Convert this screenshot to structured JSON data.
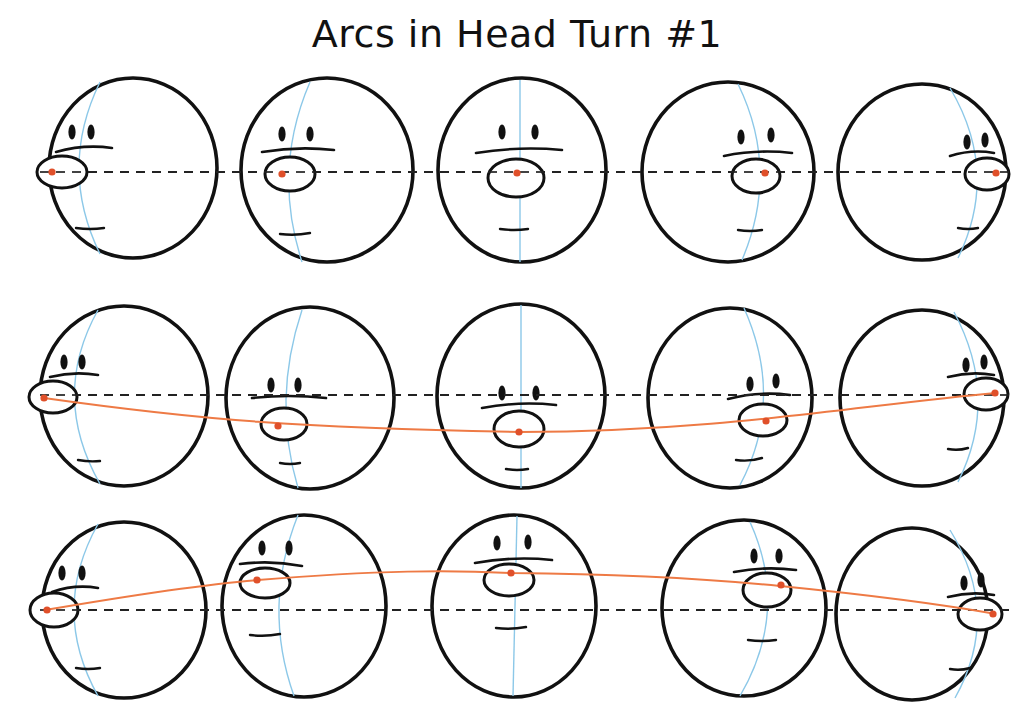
{
  "title": "Arcs in Head Turn #1",
  "colors": {
    "outline": "#111111",
    "center_line": "#8cc8e8",
    "nose_dot": "#e0502a",
    "arc": "#ee7a45",
    "guide": "#222222"
  },
  "rows": [
    {
      "name": "row-1-straight",
      "guide_y": 172,
      "arc": false,
      "heads": [
        {
          "cx": 133,
          "cy": 168,
          "rx": 84,
          "ry": 90,
          "view": "profile-left",
          "nose": {
            "x": 62,
            "y": 172,
            "rx": 25,
            "ry": 16
          },
          "dot": {
            "x": 52,
            "y": 172
          },
          "eyes": [
            {
              "x": 72,
              "y": 132
            },
            {
              "x": 91,
              "y": 132
            }
          ],
          "brow": [
            56,
            152,
            112,
            148
          ],
          "mouth": [
            76,
            228,
            104,
            228
          ],
          "center": "M 100 82 Q 58 168 100 254"
        },
        {
          "cx": 327,
          "cy": 170,
          "rx": 86,
          "ry": 92,
          "view": "three-quarter-left",
          "nose": {
            "x": 290,
            "y": 174,
            "rx": 25,
            "ry": 17
          },
          "dot": {
            "x": 282,
            "y": 174
          },
          "eyes": [
            {
              "x": 282,
              "y": 134
            },
            {
              "x": 310,
              "y": 134
            }
          ],
          "brow": [
            262,
            152,
            334,
            150
          ],
          "mouth": [
            280,
            234,
            310,
            233
          ],
          "center": "M 310 82 Q 272 170 302 262"
        },
        {
          "cx": 522,
          "cy": 170,
          "rx": 84,
          "ry": 92,
          "view": "front",
          "nose": {
            "x": 516,
            "y": 178,
            "rx": 28,
            "ry": 19
          },
          "dot": {
            "x": 517,
            "y": 173
          },
          "eyes": [
            {
              "x": 502,
              "y": 132
            },
            {
              "x": 535,
              "y": 132
            }
          ],
          "brow": [
            476,
            153,
            562,
            150
          ],
          "mouth": [
            500,
            229,
            528,
            229
          ],
          "center": "M 520 80 L 520 262"
        },
        {
          "cx": 728,
          "cy": 172,
          "rx": 86,
          "ry": 90,
          "view": "three-quarter-right",
          "nose": {
            "x": 756,
            "y": 176,
            "rx": 24,
            "ry": 17
          },
          "dot": {
            "x": 765,
            "y": 173
          },
          "eyes": [
            {
              "x": 741,
              "y": 137
            },
            {
              "x": 771,
              "y": 135
            }
          ],
          "brow": [
            724,
            156,
            792,
            153
          ],
          "mouth": [
            738,
            230,
            762,
            230
          ],
          "center": "M 738 84 Q 780 170 742 260"
        },
        {
          "cx": 922,
          "cy": 172,
          "rx": 84,
          "ry": 88,
          "view": "profile-right",
          "nose": {
            "x": 987,
            "y": 174,
            "rx": 22,
            "ry": 16
          },
          "dot": {
            "x": 996,
            "y": 173
          },
          "eyes": [
            {
              "x": 967,
              "y": 142
            },
            {
              "x": 985,
              "y": 140
            }
          ],
          "brow": [
            950,
            156,
            994,
            153
          ],
          "mouth": [
            958,
            228,
            978,
            228
          ],
          "center": "M 950 88 Q 1000 172 958 258"
        }
      ]
    },
    {
      "name": "row-2-down-arc",
      "guide_y": 395,
      "arc": true,
      "arc_path": "M 44 398 C 200 420 300 428 520 432 C 720 432 860 405 996 393",
      "heads": [
        {
          "cx": 124,
          "cy": 396,
          "rx": 84,
          "ry": 90,
          "view": "profile-left",
          "nose": {
            "x": 53,
            "y": 397,
            "rx": 24,
            "ry": 16
          },
          "dot": {
            "x": 44,
            "y": 398
          },
          "eyes": [
            {
              "x": 64,
              "y": 362
            },
            {
              "x": 82,
              "y": 362
            }
          ],
          "brow": [
            50,
            377,
            98,
            375
          ],
          "mouth": [
            78,
            460,
            100,
            461
          ],
          "center": "M 98 310 Q 50 396 100 484"
        },
        {
          "cx": 310,
          "cy": 398,
          "rx": 84,
          "ry": 91,
          "view": "three-quarter-left",
          "nose": {
            "x": 284,
            "y": 424,
            "rx": 23,
            "ry": 16
          },
          "dot": {
            "x": 278,
            "y": 426
          },
          "eyes": [
            {
              "x": 271,
              "y": 385
            },
            {
              "x": 298,
              "y": 385
            }
          ],
          "brow": [
            252,
            398,
            326,
            398
          ],
          "mouth": [
            280,
            463,
            300,
            463
          ],
          "center": "M 302 310 Q 272 400 298 488"
        },
        {
          "cx": 521,
          "cy": 396,
          "rx": 84,
          "ry": 92,
          "view": "front",
          "nose": {
            "x": 519,
            "y": 429,
            "rx": 25,
            "ry": 18
          },
          "dot": {
            "x": 519,
            "y": 432
          },
          "eyes": [
            {
              "x": 502,
              "y": 393
            },
            {
              "x": 536,
              "y": 393
            }
          ],
          "brow": [
            482,
            408,
            556,
            405
          ],
          "mouth": [
            506,
            469,
            528,
            469
          ],
          "center": "M 521 305 L 521 488"
        },
        {
          "cx": 730,
          "cy": 398,
          "rx": 82,
          "ry": 90,
          "view": "three-quarter-right",
          "nose": {
            "x": 763,
            "y": 420,
            "rx": 24,
            "ry": 16
          },
          "dot": {
            "x": 766,
            "y": 421
          },
          "eyes": [
            {
              "x": 750,
              "y": 384
            },
            {
              "x": 776,
              "y": 381
            }
          ],
          "brow": [
            728,
            399,
            790,
            395
          ],
          "mouth": [
            736,
            460,
            762,
            458
          ],
          "center": "M 744 308 Q 785 400 740 485"
        },
        {
          "cx": 922,
          "cy": 398,
          "rx": 82,
          "ry": 88,
          "view": "profile-right",
          "nose": {
            "x": 986,
            "y": 394,
            "rx": 22,
            "ry": 16
          },
          "dot": {
            "x": 995,
            "y": 393
          },
          "eyes": [
            {
              "x": 966,
              "y": 365
            },
            {
              "x": 984,
              "y": 362
            }
          ],
          "brow": [
            948,
            377,
            994,
            375
          ],
          "mouth": [
            948,
            449,
            968,
            448
          ],
          "center": "M 954 312 Q 1000 398 958 482"
        }
      ]
    },
    {
      "name": "row-3-up-arc",
      "guide_y": 610,
      "arc": true,
      "arc_path": "M 45 610 C 150 592 220 583 258 580 C 380 570 450 570 512 573 C 620 574 700 578 780 586 C 880 596 940 604 996 614",
      "heads": [
        {
          "cx": 124,
          "cy": 610,
          "rx": 82,
          "ry": 88,
          "view": "profile-left",
          "nose": {
            "x": 54,
            "y": 610,
            "rx": 24,
            "ry": 17
          },
          "dot": {
            "x": 47,
            "y": 610
          },
          "eyes": [
            {
              "x": 62,
              "y": 573
            },
            {
              "x": 82,
              "y": 573
            }
          ],
          "brow": [
            52,
            592,
            98,
            588
          ],
          "mouth": [
            76,
            668,
            100,
            668
          ],
          "center": "M 98 524 Q 50 610 98 696"
        },
        {
          "cx": 304,
          "cy": 606,
          "rx": 82,
          "ry": 91,
          "view": "three-quarter-left",
          "nose": {
            "x": 265,
            "y": 583,
            "rx": 25,
            "ry": 15
          },
          "dot": {
            "x": 257,
            "y": 580
          },
          "eyes": [
            {
              "x": 262,
              "y": 548
            },
            {
              "x": 289,
              "y": 548
            }
          ],
          "brow": [
            240,
            564,
            302,
            566
          ],
          "mouth": [
            250,
            635,
            280,
            634
          ],
          "center": "M 298 515 Q 262 606 294 696"
        },
        {
          "cx": 514,
          "cy": 606,
          "rx": 82,
          "ry": 91,
          "view": "front",
          "nose": {
            "x": 509,
            "y": 580,
            "rx": 25,
            "ry": 16
          },
          "dot": {
            "x": 511,
            "y": 573
          },
          "eyes": [
            {
              "x": 497,
              "y": 543
            },
            {
              "x": 528,
              "y": 542
            }
          ],
          "brow": [
            475,
            563,
            552,
            560
          ],
          "mouth": [
            496,
            628,
            526,
            627
          ],
          "center": "M 517 516 L 513 696"
        },
        {
          "cx": 744,
          "cy": 608,
          "rx": 82,
          "ry": 88,
          "view": "three-quarter-right",
          "nose": {
            "x": 767,
            "y": 590,
            "rx": 24,
            "ry": 17
          },
          "dot": {
            "x": 781,
            "y": 585
          },
          "eyes": [
            {
              "x": 754,
              "y": 556
            },
            {
              "x": 779,
              "y": 556
            }
          ],
          "brow": [
            734,
            572,
            796,
            570
          ],
          "mouth": [
            748,
            640,
            776,
            640
          ],
          "center": "M 750 522 Q 790 610 740 696"
        },
        {
          "cx": 912,
          "cy": 614,
          "rx": 76,
          "ry": 86,
          "view": "profile-right",
          "nose": {
            "x": 980,
            "y": 614,
            "rx": 22,
            "ry": 16
          },
          "dot": {
            "x": 993,
            "y": 614
          },
          "eyes": [
            {
              "x": 964,
              "y": 583
            },
            {
              "x": 981,
              "y": 580
            }
          ],
          "brow": [
            948,
            597,
            994,
            595
          ],
          "mouth": [
            950,
            669,
            970,
            668
          ],
          "center": "M 950 530 Q 1002 614 955 698"
        }
      ]
    }
  ]
}
